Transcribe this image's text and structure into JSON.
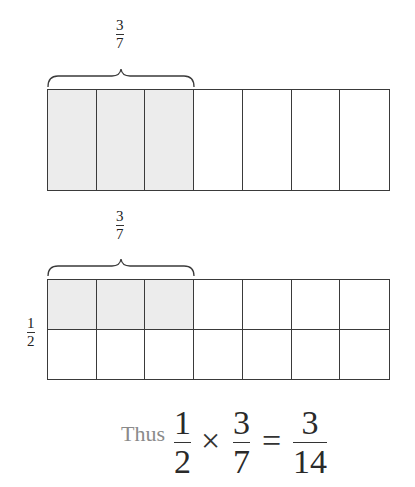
{
  "diagram": {
    "top": {
      "brace_label": {
        "numerator": "3",
        "denominator": "7"
      },
      "columns": 7,
      "rows": 1,
      "shaded_columns": 3
    },
    "bottom": {
      "brace_label": {
        "numerator": "3",
        "denominator": "7"
      },
      "side_label": {
        "numerator": "1",
        "denominator": "2"
      },
      "columns": 7,
      "rows": 2,
      "shaded_columns": 3,
      "shaded_rows": 1
    },
    "equation": {
      "prefix": "Thus",
      "lhs1": {
        "numerator": "1",
        "denominator": "2"
      },
      "times": "×",
      "lhs2": {
        "numerator": "3",
        "denominator": "7"
      },
      "equals": "=",
      "rhs": {
        "numerator": "3",
        "denominator": "14"
      }
    },
    "colors": {
      "shade": "#ececec",
      "line": "#3a3a3a",
      "muted_text": "#8a8a8a"
    }
  }
}
